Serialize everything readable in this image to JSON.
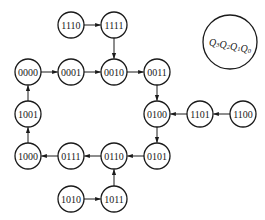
{
  "diagram": {
    "type": "state-transition",
    "legend": {
      "label": "Q3Q2Q1Q0",
      "x": 230,
      "y": 42,
      "r": 27
    },
    "node_radius": 13,
    "nodes": [
      {
        "id": "1110",
        "label": "1110",
        "x": 71,
        "y": 25
      },
      {
        "id": "1111",
        "label": "1111",
        "x": 114,
        "y": 25
      },
      {
        "id": "0000",
        "label": "0000",
        "x": 28,
        "y": 72
      },
      {
        "id": "0001",
        "label": "0001",
        "x": 71,
        "y": 72
      },
      {
        "id": "0010",
        "label": "0010",
        "x": 114,
        "y": 72
      },
      {
        "id": "0011",
        "label": "0011",
        "x": 157,
        "y": 72
      },
      {
        "id": "1001",
        "label": "1001",
        "x": 28,
        "y": 114
      },
      {
        "id": "0100",
        "label": "0100",
        "x": 157,
        "y": 114
      },
      {
        "id": "1101",
        "label": "1101",
        "x": 200,
        "y": 114
      },
      {
        "id": "1100",
        "label": "1100",
        "x": 243,
        "y": 114
      },
      {
        "id": "1000",
        "label": "1000",
        "x": 28,
        "y": 156
      },
      {
        "id": "0111",
        "label": "0111",
        "x": 71,
        "y": 156
      },
      {
        "id": "0110",
        "label": "0110",
        "x": 114,
        "y": 156
      },
      {
        "id": "0101",
        "label": "0101",
        "x": 157,
        "y": 156
      },
      {
        "id": "1010",
        "label": "1010",
        "x": 71,
        "y": 199
      },
      {
        "id": "1011",
        "label": "1011",
        "x": 114,
        "y": 199
      }
    ],
    "edges": [
      {
        "from": "1110",
        "to": "1111"
      },
      {
        "from": "1111",
        "to": "0010"
      },
      {
        "from": "0000",
        "to": "0001"
      },
      {
        "from": "0001",
        "to": "0010"
      },
      {
        "from": "0010",
        "to": "0011"
      },
      {
        "from": "0011",
        "to": "0100"
      },
      {
        "from": "1100",
        "to": "1101"
      },
      {
        "from": "1101",
        "to": "0100"
      },
      {
        "from": "0100",
        "to": "0101"
      },
      {
        "from": "0101",
        "to": "0110"
      },
      {
        "from": "0110",
        "to": "0111"
      },
      {
        "from": "0111",
        "to": "1000"
      },
      {
        "from": "1000",
        "to": "1001"
      },
      {
        "from": "1001",
        "to": "0000"
      },
      {
        "from": "1010",
        "to": "1011"
      },
      {
        "from": "1011",
        "to": "0110"
      }
    ]
  }
}
